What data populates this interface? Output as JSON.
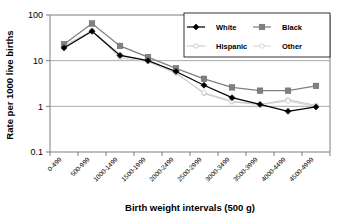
{
  "chart_data": {
    "type": "line",
    "title": "",
    "xlabel": "Birth weight intervals (500 g)",
    "ylabel": "Rate per 1000 live births",
    "yscale": "log",
    "ylim": [
      0.1,
      100
    ],
    "yticks": [
      "100",
      "10",
      "1",
      "0.1"
    ],
    "ytick_values": [
      100,
      10,
      1,
      0.1
    ],
    "grid": "horizontal",
    "legend_position": "top-right",
    "categories": [
      "0-499",
      "500-999",
      "1000-1499",
      "1500-1999",
      "2000-2499",
      "2500-2999",
      "3000-3499",
      "3500-3999",
      "4000-4499",
      "4500-4999"
    ],
    "series": [
      {
        "name": "White",
        "color": "#000000",
        "marker": "diamond",
        "values": [
          19,
          44,
          13,
          10,
          5.8,
          2.9,
          1.55,
          1.1,
          0.78,
          0.97
        ]
      },
      {
        "name": "Black",
        "color": "#808080",
        "marker": "square",
        "values": [
          23,
          65,
          21,
          12,
          6.8,
          4.0,
          2.6,
          2.2,
          2.2,
          2.8
        ]
      },
      {
        "name": "Hispanic",
        "color": "#bfbfbf",
        "marker": "line",
        "values": [
          21,
          46,
          13.5,
          10,
          5.5,
          1.9,
          1.25,
          1.1,
          1.4,
          1.05
        ]
      },
      {
        "name": "Other",
        "color": "#cccccc",
        "marker": "line",
        "values": [
          20,
          45,
          11.5,
          9.5,
          5.2,
          2.0,
          1.3,
          1.1,
          1.3,
          1.0
        ]
      }
    ]
  },
  "legend": {
    "entries": [
      {
        "label": "White"
      },
      {
        "label": "Black"
      },
      {
        "label": "Hispanic"
      },
      {
        "label": "Other"
      }
    ]
  },
  "axes": {
    "y_title": "Rate per 1000 live births",
    "x_title": "Birth weight intervals (500 g)"
  }
}
